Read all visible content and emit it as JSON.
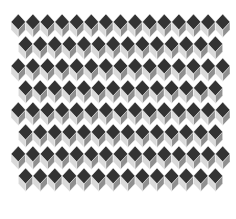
{
  "image": {
    "description": "Tumbling-blocks (isometric cube) tiling pattern",
    "width": 236,
    "height": 219
  },
  "pattern": {
    "origin_x": 11,
    "origin_y": 14,
    "cell_width": 14.6,
    "cell_height": 22,
    "columns": 15,
    "rows": 8,
    "row_offset_alternate": 7.3,
    "colors": {
      "top": "#333333",
      "left_face": "#d9d9d9",
      "right_face": "#8f8f8f",
      "outline": "#ffffff",
      "background": "#ffffff"
    }
  }
}
